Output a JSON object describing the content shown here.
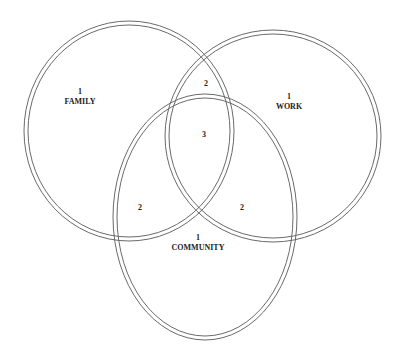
{
  "diagram": {
    "type": "venn",
    "sets": [
      {
        "id": "family",
        "label": "FAMILY",
        "count": "1"
      },
      {
        "id": "work",
        "label": "WORK",
        "count": "1"
      },
      {
        "id": "community",
        "label": "COMMUNITY",
        "count": "1"
      }
    ],
    "overlaps": {
      "family_work": "2",
      "family_community": "2",
      "work_community": "2",
      "all_three": "3"
    },
    "colors": {
      "stroke": "#6a6a6a",
      "text": "#222222",
      "background": "#ffffff"
    }
  }
}
